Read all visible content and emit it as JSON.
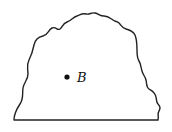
{
  "diagram": {
    "title": "",
    "region": {
      "description": "closed region with wavy upper boundary and straight bottom edge",
      "stroke_color": "#222222",
      "fill_color": "#ffffff"
    },
    "points": [
      {
        "name": "B",
        "label": "B",
        "x": 67,
        "y": 77
      }
    ],
    "colors": {
      "stroke": "#222222",
      "point": "#111111",
      "background": "#ffffff"
    }
  }
}
